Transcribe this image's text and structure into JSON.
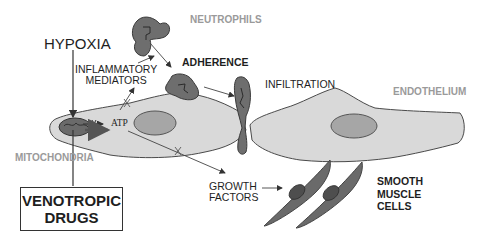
{
  "diagram": {
    "labels": {
      "hypoxia": "HYPOXIA",
      "inflammatory_mediators": [
        "INFLAMMATORY",
        "MEDIATORS"
      ],
      "neutrophils": "NEUTROPHILS",
      "adherence": "ADHERENCE",
      "infiltration": "INFILTRATION",
      "endothelium": "ENDOTHELIUM",
      "atp": "ATP",
      "mitochondria": "MITOCHONDRIA",
      "venotropic_drugs": [
        "VENOTROPIC",
        "DRUGS"
      ],
      "growth_factors": [
        "GROWTH",
        "FACTORS"
      ],
      "smooth_muscle_cells": [
        "SMOOTH",
        "MUSCLE",
        "CELLS"
      ]
    },
    "colors": {
      "cell_fill": "#d9d9d9",
      "nucleus_fill": "#a6a6a6",
      "neutrophil_fill": "#6e6e6e",
      "smooth_muscle_fill": "#6a6a6a",
      "outline": "#4a4a4a",
      "grey_label": "#9a9a9a"
    }
  }
}
